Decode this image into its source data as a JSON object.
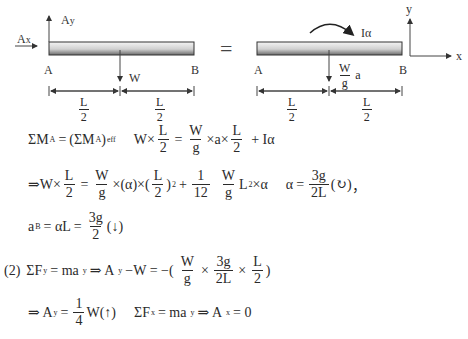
{
  "diagram": {
    "left": {
      "labels": {
        "ay": "A",
        "ay_sub": "y",
        "ax": "A",
        "ax_sub": "x",
        "a": "A",
        "b": "B",
        "w": "W"
      },
      "dims": [
        {
          "num": "L",
          "den": "2"
        },
        {
          "num": "L",
          "den": "2"
        }
      ]
    },
    "equals": "=",
    "right": {
      "labels": {
        "moment": "Iα",
        "a": "A",
        "b": "B",
        "inertia_num": "W",
        "inertia_den": "g",
        "inertia_a": "a"
      },
      "dims": [
        {
          "num": "L",
          "den": "2"
        },
        {
          "num": "L",
          "den": "2"
        }
      ]
    },
    "axes": {
      "x": "x",
      "y": "y"
    },
    "colors": {
      "beam_dark": "#3a3a3a",
      "beam_light": "#f2f2f2",
      "line": "#444444"
    }
  },
  "equations": {
    "eq1": {
      "lhs": "ΣM",
      "lhs_sub": "A",
      "eq": "=",
      "rhs": "(ΣM",
      "rhs_sub": "A",
      "rhs_close": ")",
      "rhs_sub2": "eff",
      "part2_w": "W×",
      "f1": {
        "num": "L",
        "den": "2"
      },
      "eq2": "=",
      "f2": {
        "num": "W",
        "den": "g"
      },
      "mid": "×a×",
      "f3": {
        "num": "L",
        "den": "2"
      },
      "tail": "+ Iα"
    },
    "eq2": {
      "start": "⇒W×",
      "f1": {
        "num": "L",
        "den": "2"
      },
      "eq": "=",
      "f2": {
        "num": "W",
        "den": "g"
      },
      "mid": "×(α)×(",
      "f3": {
        "num": "L",
        "den": "2"
      },
      "close": ")",
      "sq": "2",
      "plus": "+",
      "f4": {
        "num": "1",
        "den": "12"
      },
      "f5": {
        "num": "W",
        "den": "g"
      },
      "l": "L",
      "l_sq": "2",
      "times_alpha": "×α",
      "alpha": "α",
      "eq_b": "=",
      "f6": {
        "num": "3g",
        "den": "2L"
      },
      "dir": "(↻)",
      "comma": "，"
    },
    "eq3": {
      "a": "a",
      "a_sub": "B",
      "mid": "= αL =",
      "f1": {
        "num": "3g",
        "den": "2"
      },
      "dir": "(↓)"
    },
    "eq4": {
      "label": "(2)",
      "sum": "ΣF",
      "sum_sub": "y",
      "eq": "= ma",
      "ma_sub": "y",
      "imp": "⇒ A",
      "ay_sub": "y",
      "mid": "−W = −(",
      "f1": {
        "num": "W",
        "den": "g"
      },
      "x1": "×",
      "f2": {
        "num": "3g",
        "den": "2L"
      },
      "x2": "×",
      "f3": {
        "num": "L",
        "den": "2"
      },
      "close": ")"
    },
    "eq5": {
      "start": "⇒ A",
      "ay_sub": "y",
      "eq": "=",
      "f1": {
        "num": "1",
        "den": "4"
      },
      "w": "W(↑)",
      "sum": "ΣF",
      "sum_sub": "x",
      "eq2": "= ma",
      "ma_sub": "y",
      "imp": "⇒ A",
      "ax_sub": "x",
      "tail": "= 0"
    }
  }
}
